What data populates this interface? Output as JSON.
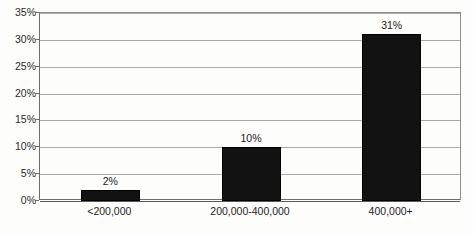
{
  "chart_data": {
    "type": "bar",
    "title": "",
    "subtitle": "",
    "xlabel": "",
    "ylabel": "",
    "categories": [
      "<200,000",
      "200,000-400,000",
      "400,000+"
    ],
    "values": [
      2,
      10,
      31
    ],
    "value_labels": [
      "2%",
      "10%",
      "31%"
    ],
    "ylim": [
      0,
      35
    ],
    "ytick_values": [
      0,
      5,
      10,
      15,
      20,
      25,
      30,
      35
    ],
    "ytick_labels": [
      "0%",
      "5%",
      "10%",
      "15%",
      "20%",
      "25%",
      "30%",
      "35%"
    ],
    "grid": true,
    "legend": false,
    "legend_position": "none",
    "series": [
      {
        "name": "",
        "values": [
          2,
          10,
          31
        ],
        "color": "#121212"
      }
    ]
  },
  "axis": {
    "gridline_color": "#a9a9a9",
    "axis_color": "#6e6e6e"
  },
  "background_color": "#fdfdfc"
}
